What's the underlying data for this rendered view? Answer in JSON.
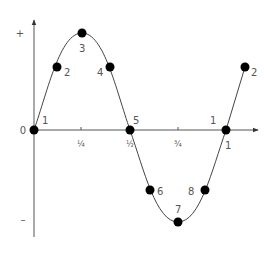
{
  "diagram": {
    "title": "",
    "axes": {
      "y_plus_label": "+",
      "y_minus_label": "–",
      "origin_label": "0",
      "x_ticks": [
        {
          "label": "¼",
          "x": 81
        },
        {
          "label": "½",
          "x": 130
        },
        {
          "label": "¾",
          "x": 178
        },
        {
          "label": "1",
          "x": 226
        }
      ]
    },
    "points": [
      {
        "label": "1",
        "x": 34,
        "y": 130,
        "lx": 42,
        "ly": 124
      },
      {
        "label": "2",
        "x": 57,
        "y": 67,
        "lx": 64,
        "ly": 76
      },
      {
        "label": "3",
        "x": 82,
        "y": 33,
        "lx": 79,
        "ly": 52
      },
      {
        "label": "4",
        "x": 110,
        "y": 67,
        "lx": 97,
        "ly": 76
      },
      {
        "label": "5",
        "x": 130,
        "y": 130,
        "lx": 133,
        "ly": 124
      },
      {
        "label": "6",
        "x": 150,
        "y": 190,
        "lx": 157,
        "ly": 195
      },
      {
        "label": "7",
        "x": 178,
        "y": 222,
        "lx": 175,
        "ly": 213
      },
      {
        "label": "8",
        "x": 205,
        "y": 190,
        "lx": 188,
        "ly": 195
      },
      {
        "label": "1",
        "x": 226,
        "y": 130,
        "lx": 210,
        "ly": 124
      },
      {
        "label": "2",
        "x": 245,
        "y": 67,
        "lx": 251,
        "ly": 76
      }
    ],
    "extra_labels": [
      {
        "label": "1",
        "lx": 225,
        "ly": 149
      }
    ],
    "colors": {
      "axis": "#555555",
      "curve": "#444444",
      "point": "#000000",
      "text": "#555555"
    }
  }
}
